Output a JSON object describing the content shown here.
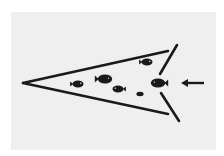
{
  "diagram": {
    "type": "fish-funnel-trap",
    "colors": {
      "outer_background": "#ffffff",
      "panel_background": "#efefef",
      "ink": "#1a1a1a"
    },
    "trap": {
      "apex": [
        23,
        83
      ],
      "top_wall_end": [
        168,
        51
      ],
      "bottom_wall_end": [
        168,
        114
      ],
      "upper_funnel_wing": [
        [
          177,
          45
        ],
        [
          160,
          74
        ]
      ],
      "lower_funnel_wing": [
        [
          161,
          93
        ],
        [
          179,
          121
        ]
      ],
      "stroke_width": 2.6
    },
    "fish": [
      {
        "id": "fish-1",
        "cx": 78,
        "cy": 84,
        "size": "medium",
        "facing": "right"
      },
      {
        "id": "fish-2",
        "cx": 105,
        "cy": 79,
        "size": "large",
        "facing": "right"
      },
      {
        "id": "fish-3",
        "cx": 118,
        "cy": 89,
        "size": "medium",
        "facing": "left"
      },
      {
        "id": "fish-4",
        "cx": 140,
        "cy": 94,
        "size": "small",
        "facing": "none"
      },
      {
        "id": "fish-5",
        "cx": 147,
        "cy": 62,
        "size": "medium",
        "facing": "right"
      },
      {
        "id": "fish-6",
        "cx": 158,
        "cy": 83,
        "size": "large",
        "facing": "left"
      }
    ],
    "arrow": {
      "from": [
        204,
        83
      ],
      "to": [
        181,
        83
      ],
      "direction": "left",
      "meaning": "entry direction into trap"
    }
  }
}
